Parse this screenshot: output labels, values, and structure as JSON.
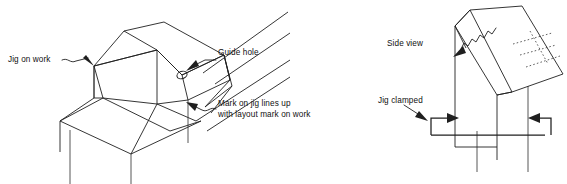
{
  "figure": {
    "background_color": "#ffffff",
    "ink_color": "#1f1f1f",
    "width": 567,
    "height": 184
  },
  "left_figure": {
    "name": "jig-on-work-isometric",
    "labels": {
      "jig_on_work": "Jig on work",
      "guide_hole": "Guide hole",
      "mark_on_jig_line1": "Mark on jig lines up",
      "mark_on_jig_line2": "with layout mark on work"
    },
    "parts": [
      "jig-body",
      "jig-angled-face",
      "guide-hole",
      "work-piece",
      "work-leg-left",
      "work-leg-right",
      "layout-mark"
    ]
  },
  "right_figure": {
    "name": "side-view-jig-clamped",
    "labels": {
      "side_view": "Side view",
      "jig_clamped": "Jig clamped"
    },
    "parts": [
      "angled-jig-block",
      "work-piece-vertical",
      "clamp-left",
      "clamp-right",
      "hidden-edge-dashed"
    ]
  }
}
